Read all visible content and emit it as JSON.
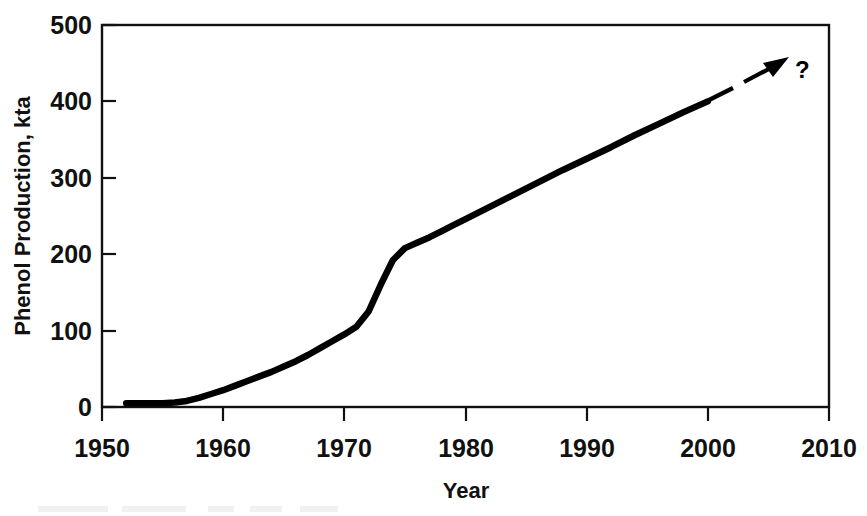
{
  "chart_data": {
    "type": "line",
    "title": "",
    "xlabel": "Year",
    "ylabel": "Phenol Production, kta",
    "xlim": [
      1950,
      2010
    ],
    "ylim": [
      0,
      500
    ],
    "xticks": [
      1950,
      1960,
      1970,
      1980,
      1990,
      2000,
      2010
    ],
    "xtick_labels": [
      "1950",
      "1960",
      "1970",
      "1980",
      "1990",
      "2000",
      "2010"
    ],
    "yticks": [
      0,
      100,
      200,
      300,
      400,
      500
    ],
    "ytick_labels": [
      "0",
      "100",
      "200",
      "300",
      "400",
      "500"
    ],
    "grid": false,
    "legend": false,
    "legend_position": "none",
    "series": [
      {
        "name": "Phenol Production",
        "style": "solid",
        "x": [
          1952,
          1953,
          1954,
          1955,
          1956,
          1957,
          1958,
          1959,
          1960,
          1961,
          1962,
          1963,
          1964,
          1965,
          1966,
          1967,
          1968,
          1969,
          1970,
          1971,
          1972,
          1973,
          1974,
          1975,
          1976,
          1977,
          1978,
          1979,
          1980,
          1982,
          1984,
          1986,
          1988,
          1990,
          1992,
          1994,
          1996,
          1998,
          2000
        ],
        "y": [
          5,
          5,
          5,
          5,
          6,
          8,
          12,
          17,
          22,
          28,
          34,
          40,
          46,
          53,
          60,
          68,
          77,
          86,
          95,
          105,
          125,
          160,
          192,
          208,
          215,
          222,
          230,
          238,
          246,
          262,
          278,
          294,
          310,
          325,
          340,
          356,
          371,
          386,
          400
        ]
      },
      {
        "name": "Extrapolation",
        "style": "dashed-arrow",
        "x": [
          2000,
          2008
        ],
        "y": [
          400,
          442
        ]
      }
    ],
    "annotations": [
      {
        "text": "?",
        "x": 2008.8,
        "y": 448
      }
    ]
  },
  "axes": {
    "x_title": "Year",
    "y_title": "Phenol Production, kta"
  }
}
